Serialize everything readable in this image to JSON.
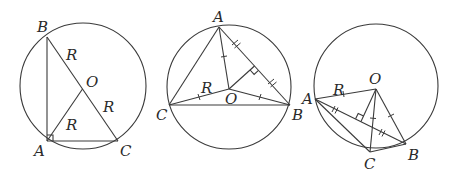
{
  "figures": [
    {
      "id": "fig1",
      "description": "Right triangle ABC inscribed in circle, hypotenuse BC is a diameter through center O",
      "labels": {
        "B": "B",
        "A": "A",
        "C": "C",
        "O": "O",
        "R_OB": "R",
        "R_OC": "R",
        "R_OA": "R"
      }
    },
    {
      "id": "fig2",
      "description": "Acute triangle ABC inscribed in circle with center O inside; OA, OB, OC equal radii; perpendicular from O bisects AB",
      "labels": {
        "A": "A",
        "B": "B",
        "C": "C",
        "O": "O",
        "R_OC": "R"
      }
    },
    {
      "id": "fig3",
      "description": "Obtuse triangle ABC inscribed in circle with center O outside; OA, OB, OC radii; perpendicular from O bisects AB",
      "labels": {
        "A": "A",
        "B": "B",
        "C": "C",
        "O": "O",
        "R_OA": "R"
      }
    }
  ],
  "colors": {
    "stroke": "#3a3a3a",
    "text": "#2a2a2a",
    "background": "#ffffff"
  }
}
